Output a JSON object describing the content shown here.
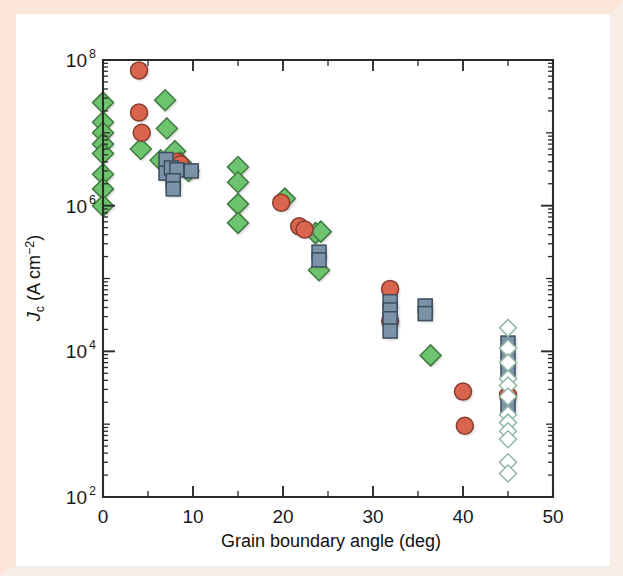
{
  "figure": {
    "background_color": "#ffffff",
    "border_color": "#fbe6d8",
    "axis_color": "#2b2b2b"
  },
  "chart_data": {
    "type": "scatter",
    "title": "",
    "xlabel": "Grain boundary angle (deg)",
    "ylabel": "Jc (A cm-2)",
    "ylabel_parts": {
      "symbol": "J",
      "symbol_sub": "c",
      "unit_open": " (A cm",
      "unit_exp": "−2",
      "unit_close": ")"
    },
    "xlim": [
      0,
      50
    ],
    "ylim": [
      100,
      100000000
    ],
    "yscale": "log",
    "xscale": "linear",
    "grid": false,
    "legend": "none",
    "xticks": [
      0,
      10,
      20,
      30,
      40,
      50
    ],
    "xticklabels": [
      "0",
      "10",
      "20",
      "30",
      "40",
      "50"
    ],
    "x_minor_ticks": [
      5,
      15,
      25,
      35,
      45
    ],
    "yticks": [
      100,
      10000,
      1000000,
      100000000
    ],
    "yticklabels": [
      {
        "base": "10",
        "exp": "2"
      },
      {
        "base": "10",
        "exp": "4"
      },
      {
        "base": "10",
        "exp": "6"
      },
      {
        "base": "10",
        "exp": "8"
      }
    ],
    "series": [
      {
        "name": "green-diamond-filled",
        "marker": "diamond",
        "fill": "#6ec46e",
        "edge": "#3f7b3f",
        "filled": true,
        "points": [
          [
            0.0,
            26000000
          ],
          [
            0.0,
            14000000
          ],
          [
            0.0,
            10000000
          ],
          [
            0.0,
            7000000
          ],
          [
            0.0,
            5200000
          ],
          [
            0.0,
            2700000
          ],
          [
            0.0,
            1700000
          ],
          [
            0.0,
            1000000
          ],
          [
            4.2,
            6000000
          ],
          [
            6.4,
            4200000
          ],
          [
            6.9,
            28000000
          ],
          [
            7.1,
            11500000
          ],
          [
            8.0,
            5600000
          ],
          [
            8.6,
            3900000
          ],
          [
            9.5,
            3000000
          ],
          [
            15.0,
            3400000
          ],
          [
            15.0,
            2100000
          ],
          [
            15.0,
            1050000
          ],
          [
            15.0,
            580000
          ],
          [
            20.2,
            1250000
          ],
          [
            23.6,
            420000
          ],
          [
            24.2,
            440000
          ],
          [
            24.0,
            130000
          ],
          [
            36.4,
            8800
          ]
        ]
      },
      {
        "name": "red-circle-filled",
        "marker": "circle",
        "fill": "#d9654e",
        "edge": "#8a3a2c",
        "filled": true,
        "points": [
          [
            4.0,
            72000000
          ],
          [
            4.0,
            19000000
          ],
          [
            4.3,
            10000000
          ],
          [
            8.2,
            4000000
          ],
          [
            8.6,
            3700000
          ],
          [
            19.8,
            1100000
          ],
          [
            21.8,
            520000
          ],
          [
            22.4,
            470000
          ],
          [
            31.9,
            72000
          ],
          [
            31.9,
            26000
          ],
          [
            40.0,
            2800
          ],
          [
            40.2,
            950
          ],
          [
            45.0,
            2500
          ]
        ]
      },
      {
        "name": "blue-square-filled",
        "marker": "square",
        "fill": "#7b93a8",
        "edge": "#3d4d5c",
        "filled": true,
        "points": [
          [
            7.0,
            4300000
          ],
          [
            7.0,
            2800000
          ],
          [
            7.6,
            3300000
          ],
          [
            8.2,
            3100000
          ],
          [
            7.8,
            2200000
          ],
          [
            7.8,
            1700000
          ],
          [
            9.8,
            3000000
          ],
          [
            24.0,
            230000
          ],
          [
            24.0,
            180000
          ],
          [
            31.9,
            48000
          ],
          [
            31.9,
            37000
          ],
          [
            31.9,
            28000
          ],
          [
            31.9,
            19000
          ],
          [
            35.8,
            42000
          ],
          [
            35.8,
            33000
          ],
          [
            45.0,
            13000
          ],
          [
            45.0,
            8200
          ],
          [
            45.0,
            5600
          ],
          [
            45.0,
            1800
          ]
        ]
      },
      {
        "name": "green-diamond-open",
        "marker": "diamond",
        "fill": "#ffffff",
        "edge": "#93b8a4",
        "filled": false,
        "points": [
          [
            45.0,
            21000
          ],
          [
            45.0,
            11000
          ],
          [
            45.0,
            7000
          ],
          [
            45.0,
            4200
          ],
          [
            45.0,
            3400
          ],
          [
            45.0,
            2400
          ],
          [
            45.0,
            1350
          ],
          [
            45.0,
            1050
          ],
          [
            45.0,
            800
          ],
          [
            45.0,
            620
          ],
          [
            45.0,
            300
          ],
          [
            45.0,
            210
          ]
        ]
      }
    ]
  }
}
